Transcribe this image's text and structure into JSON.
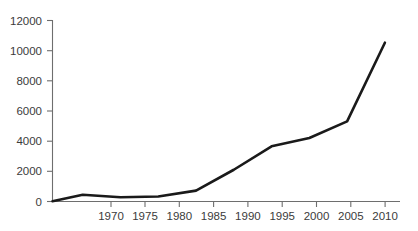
{
  "chart_data": {
    "type": "line",
    "title": "",
    "subtitle": "",
    "xlabel": "",
    "ylabel": "",
    "x": [
      1966,
      1970,
      1975,
      1980,
      1985,
      1990,
      1995,
      2000,
      2005,
      2010
    ],
    "values": [
      20,
      450,
      280,
      330,
      720,
      2100,
      3650,
      4200,
      5300,
      10500
    ],
    "series": [
      {
        "name": "",
        "x": [
          1966,
          1970,
          1975,
          1980,
          1985,
          1990,
          1995,
          2000,
          2005,
          2010
        ],
        "values": [
          20,
          450,
          280,
          330,
          720,
          2100,
          3650,
          4200,
          5300,
          10500
        ]
      }
    ],
    "xlim": [
      1966,
      2012
    ],
    "ylim": [
      0,
      12000
    ],
    "xticks": [
      1970,
      1975,
      1980,
      1985,
      1990,
      1995,
      2000,
      2005,
      2010
    ],
    "yticks": [
      0,
      2000,
      4000,
      6000,
      8000,
      10000,
      12000
    ],
    "xtick_labels": [
      "1970",
      "1975",
      "1980",
      "1985",
      "1990",
      "1995",
      "2000",
      "2005",
      "2010"
    ],
    "ytick_labels": [
      "0",
      "2000",
      "4000",
      "6000",
      "8000",
      "10000",
      "12000"
    ],
    "grid": false,
    "legend": false,
    "legend_position": "none",
    "line_color": "#1a1a1a",
    "axis_color": "#6e6e6e",
    "text_color": "#3b3b3b",
    "background_color": "#ffffff"
  },
  "axes": {
    "y": {
      "ticks": [
        {
          "label": "12000",
          "value": 12000
        },
        {
          "label": "10000",
          "value": 10000
        },
        {
          "label": "8000",
          "value": 8000
        },
        {
          "label": "6000",
          "value": 6000
        },
        {
          "label": "4000",
          "value": 4000
        },
        {
          "label": "2000",
          "value": 2000
        },
        {
          "label": "0",
          "value": 0
        }
      ]
    },
    "x": {
      "ticks": [
        {
          "label": "1970",
          "value": 1970
        },
        {
          "label": "1975",
          "value": 1975
        },
        {
          "label": "1980",
          "value": 1980
        },
        {
          "label": "1985",
          "value": 1985
        },
        {
          "label": "1990",
          "value": 1990
        },
        {
          "label": "1995",
          "value": 1995
        },
        {
          "label": "2000",
          "value": 2000
        },
        {
          "label": "2005",
          "value": 2005
        },
        {
          "label": "2010",
          "value": 2010
        }
      ]
    }
  }
}
